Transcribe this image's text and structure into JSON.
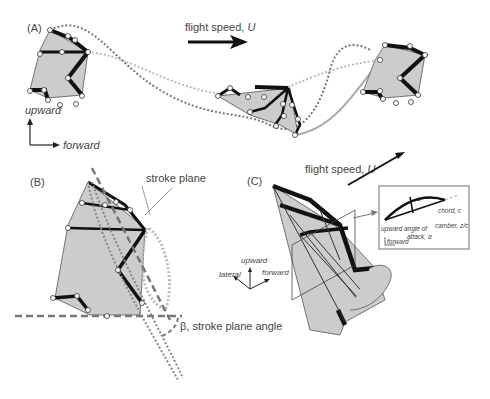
{
  "figure": {
    "panels": [
      {
        "id": "A",
        "label": "(A)",
        "flight_speed_label": "flight speed, ",
        "flight_speed_symbol": "U",
        "axis_up": "upward",
        "axis_forward": "forward"
      },
      {
        "id": "B",
        "label": "(B)",
        "stroke_plane_label": "stroke plane",
        "beta_label": "β, stroke plane angle"
      },
      {
        "id": "C",
        "label": "(C)",
        "flight_speed_label": "flight speed, ",
        "flight_speed_symbol": "U",
        "axis_up": "upward",
        "axis_lateral": "lateral",
        "axis_forward": "forward",
        "inset": {
          "z_label": "z",
          "chord_label": "chord, c",
          "camber_label": "camber, z/c",
          "aoa_label_1": "angle of",
          "aoa_label_2": "attack, α",
          "up_label": "upward",
          "forward_label": "forward"
        }
      }
    ]
  }
}
